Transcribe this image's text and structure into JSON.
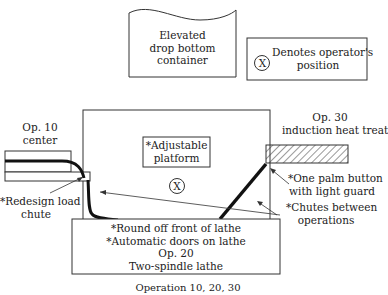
{
  "container": {
    "lines": [
      "Elevated",
      "drop bottom",
      "container"
    ]
  },
  "legend": {
    "symbol": "X",
    "lines": [
      "Denotes operator's",
      "position"
    ]
  },
  "op10": {
    "lines": [
      "Op. 10",
      "center"
    ]
  },
  "op30": {
    "lines": [
      "Op. 30",
      "induction heat treat"
    ]
  },
  "platform": {
    "lines": [
      "*Adjustable",
      "platform"
    ]
  },
  "operator_symbol": "X",
  "redesign": {
    "lines": [
      "*Redesign load",
      "chute"
    ]
  },
  "palm": {
    "lines": [
      "*One palm button",
      "with light guard"
    ]
  },
  "chutes": {
    "lines": [
      "*Chutes between",
      "operations"
    ]
  },
  "op20": {
    "lines": [
      "*Round off front of lathe",
      "*Automatic doors on lathe",
      "Op. 20",
      "Two-spindle lathe"
    ]
  },
  "caption": "Operation 10, 20, 30"
}
